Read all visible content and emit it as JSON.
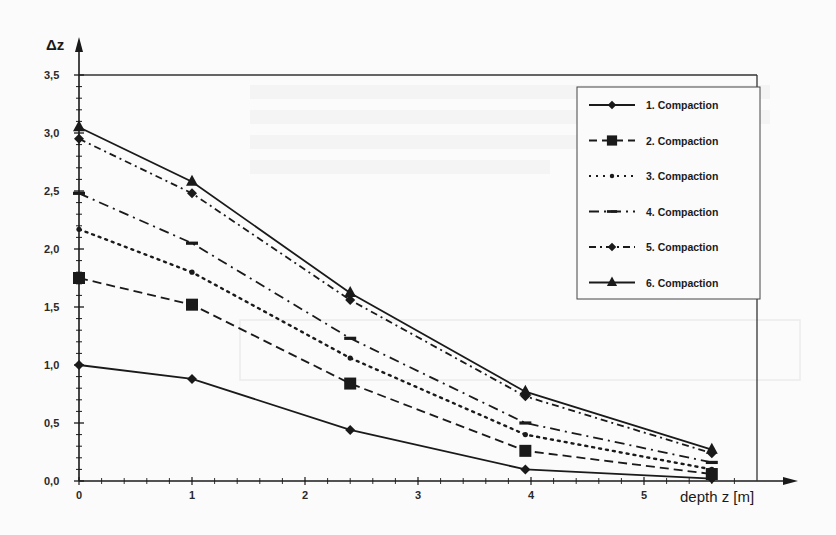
{
  "chart_data": {
    "type": "line",
    "title": "",
    "xlabel": "depth  z [m]",
    "ylabel": "Δz",
    "xlim": [
      0,
      6
    ],
    "ylim": [
      0,
      3.5
    ],
    "x_ticks": [
      "0",
      "1",
      "2",
      "3",
      "4",
      "5"
    ],
    "y_ticks": [
      "0,0",
      "0,5",
      "1,0",
      "1,5",
      "2,0",
      "2,5",
      "3,0",
      "3,5"
    ],
    "grid": false,
    "legend_position": "upper right",
    "x": [
      0,
      1,
      2.4,
      3.95,
      5.6
    ],
    "series": [
      {
        "name": "1. Compaction",
        "values": [
          1.0,
          0.88,
          0.44,
          0.1,
          0.02
        ],
        "line": "solid",
        "marker": "diamond"
      },
      {
        "name": "2. Compaction",
        "values": [
          1.75,
          1.52,
          0.84,
          0.26,
          0.06
        ],
        "line": "dashed",
        "marker": "square"
      },
      {
        "name": "3. Compaction",
        "values": [
          2.17,
          1.8,
          1.06,
          0.4,
          0.1
        ],
        "line": "dotted",
        "marker": "dot"
      },
      {
        "name": "4. Compaction",
        "values": [
          2.48,
          2.05,
          1.23,
          0.5,
          0.16
        ],
        "line": "dashdot",
        "marker": "dash"
      },
      {
        "name": "5. Compaction",
        "values": [
          2.95,
          2.48,
          1.56,
          0.73,
          0.24
        ],
        "line": "dashdot-dense",
        "marker": "diamond"
      },
      {
        "name": "6. Compaction",
        "values": [
          3.05,
          2.58,
          1.62,
          0.77,
          0.27
        ],
        "line": "solid",
        "marker": "triangle"
      }
    ]
  },
  "colors": {
    "ink": "#1a1a1a",
    "frame": "#333333",
    "background": "#fbfbfb",
    "bleed": "#e8e8e8"
  }
}
